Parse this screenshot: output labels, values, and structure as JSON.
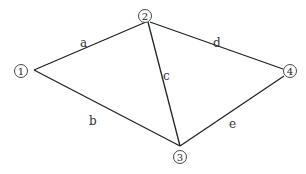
{
  "nodes": [
    {
      "id": "1",
      "label": "1",
      "x": 20,
      "y": 71
    },
    {
      "id": "2",
      "label": "2",
      "x": 146,
      "y": 16
    },
    {
      "id": "3",
      "label": "3",
      "x": 179,
      "y": 158
    },
    {
      "id": "4",
      "label": "4",
      "x": 290,
      "y": 71
    }
  ],
  "edges": [
    {
      "id": "a",
      "label": "a",
      "from": "1",
      "to": "2",
      "lx": 83,
      "ly": 46
    },
    {
      "id": "b",
      "label": "b",
      "from": "1",
      "to": "3",
      "lx": 92,
      "ly": 124
    },
    {
      "id": "c",
      "label": "c",
      "from": "2",
      "to": "3",
      "lx": 166,
      "ly": 76
    },
    {
      "id": "d",
      "label": "d",
      "from": "2",
      "to": "4",
      "lx": 216,
      "ly": 45
    },
    {
      "id": "e",
      "label": "e",
      "from": "3",
      "to": "4",
      "lx": 232,
      "ly": 127
    }
  ]
}
